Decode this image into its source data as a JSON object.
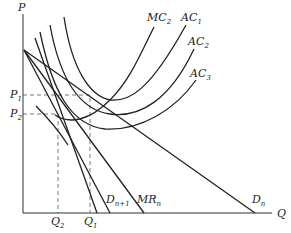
{
  "diagram": {
    "type": "economics-cost-demand",
    "axes": {
      "y_label": "P",
      "x_label": "Q"
    },
    "price_ticks": [
      {
        "base": "P",
        "sub": "1"
      },
      {
        "base": "P",
        "sub": "2"
      }
    ],
    "quantity_ticks": [
      {
        "base": "Q",
        "sub": "2"
      },
      {
        "base": "Q",
        "sub": "1"
      }
    ],
    "curves": [
      {
        "base": "MC",
        "sub": "2"
      },
      {
        "base": "AC",
        "sub": "1"
      },
      {
        "base": "AC",
        "sub": "2"
      },
      {
        "base": "AC",
        "sub": "3"
      },
      {
        "base": "D",
        "sub": "n+1"
      },
      {
        "base": "MR",
        "sub": "n"
      },
      {
        "base": "D",
        "sub": "n"
      }
    ],
    "colors": {
      "line": "#222222",
      "dash": "#555555",
      "background": "#ffffff"
    }
  }
}
